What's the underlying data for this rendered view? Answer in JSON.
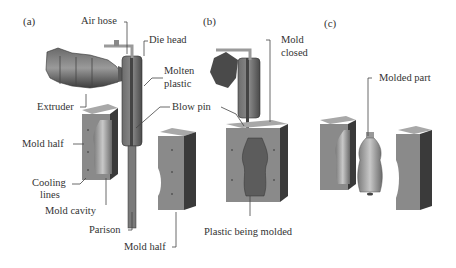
{
  "figure": {
    "panels": [
      {
        "id": "a",
        "label": "(a)"
      },
      {
        "id": "b",
        "label": "(b)"
      },
      {
        "id": "c",
        "label": "(c)"
      }
    ],
    "labels": {
      "air_hose": "Air hose",
      "die_head": "Die head",
      "molten_plastic_1": "Molten",
      "molten_plastic_2": "plastic",
      "extruder": "Extruder",
      "blow_pin": "Blow pin",
      "mold_half_left": "Mold half",
      "cooling_lines_1": "Cooling",
      "cooling_lines_2": "lines",
      "mold_cavity": "Mold cavity",
      "parison": "Parison",
      "mold_half_right": "Mold half",
      "mold_closed_1": "Mold",
      "mold_closed_2": "closed",
      "plastic_being_molded": "Plastic being molded",
      "molded_part": "Molded part"
    },
    "colors": {
      "mold_face": "#8a8a8a",
      "mold_side": "#3a3a3a",
      "mold_top": "#a8a8a8",
      "extruder": "#555555",
      "leader": "#444444",
      "text": "#333333"
    }
  }
}
